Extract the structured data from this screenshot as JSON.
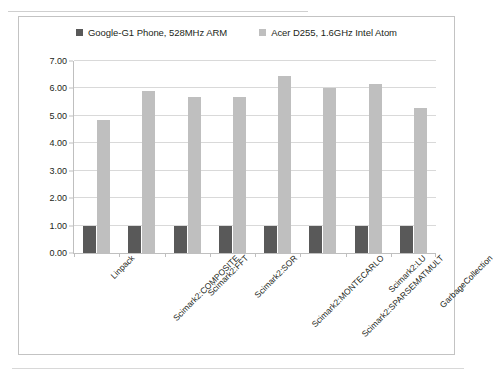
{
  "chart_data": {
    "type": "bar",
    "title": "",
    "xlabel": "",
    "ylabel": "",
    "ylim": [
      0,
      7
    ],
    "ytick_step": 1,
    "ytick_labels": [
      "7.00",
      "6.00",
      "5.00",
      "4.00",
      "3.00",
      "2.00",
      "1.00",
      "0.00"
    ],
    "grid": true,
    "legend_position": "top",
    "categories": [
      "Linpack",
      "Scimark2:COMPOSITE",
      "Scimark2:FFT",
      "Scimark2:SOR",
      "Scimark2:MONTECARLO",
      "Scimark2:SPARSEMATMULT",
      "Scimark2:LU",
      "GarbageCollection"
    ],
    "series": [
      {
        "name": "Google-G1 Phone, 528MHz ARM",
        "color": "#595959",
        "values": [
          1.0,
          1.0,
          1.0,
          1.0,
          1.0,
          1.0,
          1.0,
          1.0
        ]
      },
      {
        "name": "Acer D255, 1.6GHz Intel Atom",
        "color": "#bfbfbf",
        "values": [
          4.85,
          5.9,
          5.7,
          5.7,
          6.45,
          6.0,
          6.15,
          5.3
        ]
      }
    ]
  }
}
